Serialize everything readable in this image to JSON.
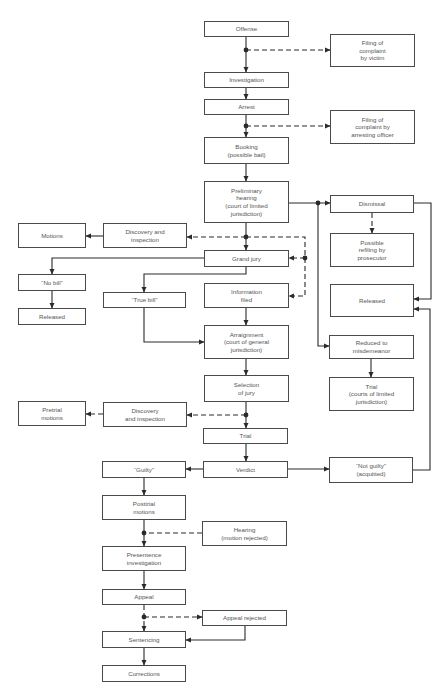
{
  "diagram": {
    "type": "flowchart",
    "colors": {
      "line": "#2a2a2a",
      "border": "#4a4a4a",
      "text": "#555555",
      "background": "#ffffff"
    },
    "nodes": [
      {
        "id": "offense",
        "label": "Offense",
        "x": 204,
        "y": 21,
        "w": 85,
        "h": 16
      },
      {
        "id": "filing_victim",
        "label": "Filing of\ncomplaint\nby victim",
        "x": 330,
        "y": 34,
        "w": 85,
        "h": 33
      },
      {
        "id": "investigation",
        "label": "Investigation",
        "x": 204,
        "y": 72,
        "w": 85,
        "h": 16
      },
      {
        "id": "arrest",
        "label": "Arrest",
        "x": 204,
        "y": 99,
        "w": 85,
        "h": 16
      },
      {
        "id": "filing_officer",
        "label": "Filing of\ncomplaint by\narresting officer",
        "x": 330,
        "y": 110,
        "w": 85,
        "h": 34
      },
      {
        "id": "booking",
        "label": "Booking\n(possible bail)",
        "x": 204,
        "y": 137,
        "w": 85,
        "h": 27
      },
      {
        "id": "preliminary",
        "label": "Preliminary\nhearing\n(court of limited\njurisdiction)",
        "x": 204,
        "y": 181,
        "w": 85,
        "h": 42
      },
      {
        "id": "dismissal",
        "label": "Dismissal",
        "x": 330,
        "y": 195,
        "w": 84,
        "h": 18
      },
      {
        "id": "motions",
        "label": "Motions",
        "x": 18,
        "y": 223,
        "w": 68,
        "h": 25
      },
      {
        "id": "discovery1",
        "label": "Discovery and\ninspection",
        "x": 103,
        "y": 223,
        "w": 84,
        "h": 25
      },
      {
        "id": "refiling",
        "label": "Possible\nrefiling by\nprosecutor",
        "x": 330,
        "y": 233,
        "w": 84,
        "h": 34
      },
      {
        "id": "grand_jury",
        "label": "Grand jury",
        "x": 204,
        "y": 250,
        "w": 85,
        "h": 17
      },
      {
        "id": "no_bill",
        "label": "“No bill”",
        "x": 18,
        "y": 274,
        "w": 68,
        "h": 17
      },
      {
        "id": "information",
        "label": "Information\nfiled",
        "x": 204,
        "y": 283,
        "w": 85,
        "h": 25
      },
      {
        "id": "released_right",
        "label": "Released",
        "x": 330,
        "y": 284,
        "w": 84,
        "h": 33
      },
      {
        "id": "true_bill",
        "label": "“True bill”",
        "x": 103,
        "y": 292,
        "w": 83,
        "h": 16
      },
      {
        "id": "released_left",
        "label": "Released",
        "x": 18,
        "y": 308,
        "w": 68,
        "h": 17
      },
      {
        "id": "arraignment",
        "label": "Arraignment\n(court of general\njurisdiction)",
        "x": 204,
        "y": 325,
        "w": 85,
        "h": 34
      },
      {
        "id": "misdemeanor",
        "label": "Reduced to\nmisdemeanor",
        "x": 329,
        "y": 335,
        "w": 85,
        "h": 24
      },
      {
        "id": "selection",
        "label": "Selection\nof jury",
        "x": 204,
        "y": 375,
        "w": 85,
        "h": 27
      },
      {
        "id": "trial_limited",
        "label": "Trial\n(courts of limited\njurisdiction)",
        "x": 329,
        "y": 377,
        "w": 85,
        "h": 34
      },
      {
        "id": "pretrial",
        "label": "Pretrial\nmotions",
        "x": 18,
        "y": 401,
        "w": 68,
        "h": 25
      },
      {
        "id": "discovery2",
        "label": "Discovery\nand inspection",
        "x": 103,
        "y": 402,
        "w": 84,
        "h": 25
      },
      {
        "id": "trial",
        "label": "Trial",
        "x": 203,
        "y": 428,
        "w": 85,
        "h": 16
      },
      {
        "id": "not_guilty",
        "label": "“Not guilty”\n(acquitted)",
        "x": 329,
        "y": 457,
        "w": 84,
        "h": 26
      },
      {
        "id": "guilty",
        "label": "“Guilty”",
        "x": 102,
        "y": 461,
        "w": 84,
        "h": 17
      },
      {
        "id": "verdict",
        "label": "Verdict",
        "x": 203,
        "y": 461,
        "w": 85,
        "h": 17
      },
      {
        "id": "posttrial",
        "label": "Posttrial\nmotions",
        "x": 102,
        "y": 495,
        "w": 84,
        "h": 25
      },
      {
        "id": "hearing",
        "label": "Hearing\n(motion rejected)",
        "x": 202,
        "y": 521,
        "w": 85,
        "h": 25
      },
      {
        "id": "presentence",
        "label": "Presentence\ninvestigation",
        "x": 102,
        "y": 546,
        "w": 84,
        "h": 25
      },
      {
        "id": "appeal",
        "label": "Appeal",
        "x": 102,
        "y": 589,
        "w": 84,
        "h": 16
      },
      {
        "id": "appeal_rejected",
        "label": "Appeal rejected",
        "x": 202,
        "y": 610,
        "w": 85,
        "h": 16
      },
      {
        "id": "sentencing",
        "label": "Sentencing",
        "x": 102,
        "y": 631,
        "w": 84,
        "h": 17
      },
      {
        "id": "corrections",
        "label": "Corrections",
        "x": 102,
        "y": 665,
        "w": 84,
        "h": 17
      }
    ],
    "edges": [
      {
        "d": "M246 37 L246 72",
        "style": "solid",
        "arrow": true
      },
      {
        "d": "M246 50 L330 50",
        "style": "dashed",
        "arrow": true
      },
      {
        "d": "M246 88 L246 99",
        "style": "solid",
        "arrow": true
      },
      {
        "d": "M246 115 L246 137",
        "style": "solid",
        "arrow": true
      },
      {
        "d": "M246 126 L330 126",
        "style": "dashed",
        "arrow": true
      },
      {
        "d": "M246 164 L246 181",
        "style": "solid",
        "arrow": true
      },
      {
        "d": "M289 203 L330 203",
        "style": "solid",
        "arrow": true
      },
      {
        "d": "M318 203 L318 346 L329 346",
        "style": "solid",
        "arrow": true
      },
      {
        "d": "M372 213 L372 233",
        "style": "dashed",
        "arrow": true
      },
      {
        "d": "M414 203 L431 203 L431 299 L414 299",
        "style": "solid",
        "arrow": true
      },
      {
        "d": "M246 223 L246 250",
        "style": "solid",
        "arrow": true
      },
      {
        "d": "M246 237 L187 237",
        "style": "dashed",
        "arrow": true
      },
      {
        "d": "M246 237 L305 237 L305 296 L289 296",
        "style": "dashed",
        "arrow": true
      },
      {
        "d": "M305 258 L289 258",
        "style": "dashed",
        "arrow": true
      },
      {
        "d": "M103 236 L86 236",
        "style": "solid",
        "arrow": true
      },
      {
        "d": "M204 258 L52 258 L52 274",
        "style": "solid",
        "arrow": true
      },
      {
        "d": "M246 267 L246 274 L144 274 L144 292",
        "style": "solid",
        "arrow": true
      },
      {
        "d": "M52 291 L52 308",
        "style": "solid",
        "arrow": true
      },
      {
        "d": "M144 308 L144 342 L204 342",
        "style": "solid",
        "arrow": true
      },
      {
        "d": "M246 308 L246 325",
        "style": "solid",
        "arrow": true
      },
      {
        "d": "M371 359 L371 377",
        "style": "solid",
        "arrow": true
      },
      {
        "d": "M246 359 L246 375",
        "style": "solid",
        "arrow": true
      },
      {
        "d": "M246 402 L246 428",
        "style": "solid",
        "arrow": true
      },
      {
        "d": "M246 415 L187 415",
        "style": "dashed",
        "arrow": true
      },
      {
        "d": "M103 414 L86 414",
        "style": "dashed",
        "arrow": true
      },
      {
        "d": "M246 444 L246 461",
        "style": "solid",
        "arrow": true
      },
      {
        "d": "M203 469 L186 469",
        "style": "solid",
        "arrow": true
      },
      {
        "d": "M288 469 L329 469",
        "style": "solid",
        "arrow": true
      },
      {
        "d": "M413 470 L430 470 L430 309 L414 309",
        "style": "solid",
        "arrow": true
      },
      {
        "d": "M144 478 L144 495",
        "style": "solid",
        "arrow": true
      },
      {
        "d": "M144 520 L144 546",
        "style": "solid",
        "arrow": true
      },
      {
        "d": "M202 533 L144 533",
        "style": "dashed",
        "arrow": false
      },
      {
        "d": "M144 571 L144 589",
        "style": "solid",
        "arrow": true
      },
      {
        "d": "M144 605 L144 631",
        "style": "dashed",
        "arrow": true
      },
      {
        "d": "M144 617 L202 617",
        "style": "dashed",
        "arrow": true
      },
      {
        "d": "M245 626 L245 640 L186 640",
        "style": "solid",
        "arrow": true
      },
      {
        "d": "M144 648 L144 665",
        "style": "solid",
        "arrow": true
      }
    ],
    "junctions": [
      {
        "x": 246,
        "y": 50
      },
      {
        "x": 246,
        "y": 126
      },
      {
        "x": 318,
        "y": 203
      },
      {
        "x": 246,
        "y": 237
      },
      {
        "x": 305,
        "y": 258
      },
      {
        "x": 246,
        "y": 415
      },
      {
        "x": 144,
        "y": 533
      },
      {
        "x": 144,
        "y": 617
      }
    ]
  }
}
